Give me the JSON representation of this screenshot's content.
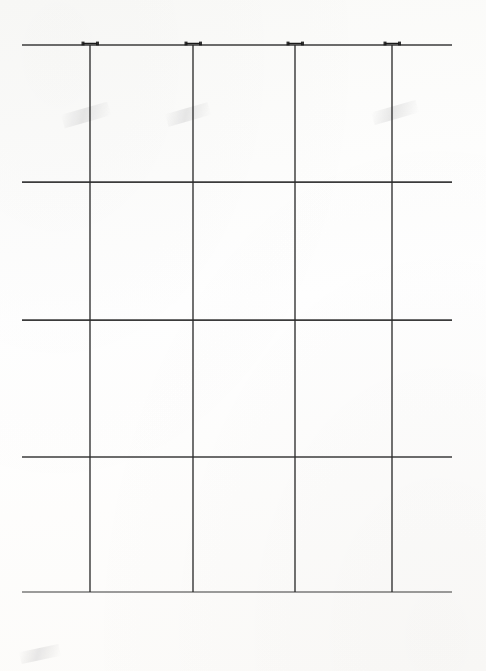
{
  "drawing": {
    "type": "structural-frame-elevation",
    "title": "Structural Frame Elevation",
    "sheet_background": "#fdfdfc",
    "line_color": "#2b2b2b",
    "node_color": "#1a1a1a",
    "scan_artifact_color": "#5a5a5f"
  },
  "geometry": {
    "beam_left_x": 22,
    "beam_right_x": 452,
    "column_xs": [
      90,
      193,
      295,
      392
    ],
    "beam_ys": [
      45,
      182,
      320,
      457,
      592
    ],
    "column_top_y": 45,
    "column_bottom_y": 592,
    "beam_count": 5,
    "column_count": 4,
    "bay_count": 3,
    "story_count": 4
  },
  "grid": {
    "columns": [
      {
        "id": "C1",
        "x": 90
      },
      {
        "id": "C2",
        "x": 193
      },
      {
        "id": "C3",
        "x": 295
      },
      {
        "id": "C4",
        "x": 392
      }
    ],
    "beams": [
      {
        "id": "B1",
        "level": "roof",
        "y": 45,
        "weight": 1.35
      },
      {
        "id": "B2",
        "level": "level-4",
        "y": 182,
        "weight": 1.75
      },
      {
        "id": "B3",
        "level": "level-3",
        "y": 320,
        "weight": 1.75
      },
      {
        "id": "B4",
        "level": "level-2",
        "y": 457,
        "weight": 1.55
      },
      {
        "id": "B5",
        "level": "base",
        "y": 592,
        "weight": 1.2
      }
    ]
  },
  "joints": {
    "end_joint_style": "horizontal-pair",
    "interior_joint_style": "four-quadrant",
    "label_text": "·",
    "rows": [
      {
        "y": 45,
        "style": "horizontal-pair",
        "labels_per_joint": 2
      },
      {
        "y": 182,
        "style": "four-quadrant",
        "labels_per_joint": 4
      },
      {
        "y": 320,
        "style": "four-quadrant",
        "labels_per_joint": 4
      },
      {
        "y": 457,
        "style": "four-quadrant",
        "labels_per_joint": 4
      },
      {
        "y": 592,
        "style": "horizontal-pair",
        "labels_per_joint": 2
      }
    ]
  },
  "dimension_line": {
    "y": 631,
    "extension_top_y": 606,
    "tick_style": "slash",
    "spans": [
      {
        "from": "C1",
        "to": "C2",
        "x1": 90,
        "x2": 193,
        "label": "1350"
      },
      {
        "from": "C2",
        "to": "C3",
        "x1": 193,
        "x2": 295,
        "label": "1350"
      },
      {
        "from": "C3",
        "to": "C4",
        "x1": 295,
        "x2": 392,
        "label": "1350"
      }
    ],
    "units": "mm"
  },
  "artifacts": [
    {
      "name": "smudge-upper-left",
      "x": 62,
      "y": 108,
      "w": 48,
      "h": 14,
      "rotate": -16
    },
    {
      "name": "smudge-upper-mid",
      "x": 166,
      "y": 108,
      "w": 44,
      "h": 13,
      "rotate": -16
    },
    {
      "name": "smudge-upper-right",
      "x": 372,
      "y": 106,
      "w": 46,
      "h": 13,
      "rotate": -16
    },
    {
      "name": "smudge-lower-left",
      "x": 20,
      "y": 648,
      "w": 40,
      "h": 12,
      "rotate": -12
    }
  ]
}
